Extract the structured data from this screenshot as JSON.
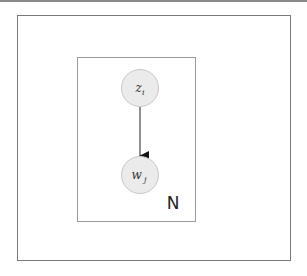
{
  "diagram": {
    "type": "plate-notation",
    "nodes": [
      {
        "id": "z",
        "base": "z",
        "subscript": "i",
        "fill": "#ebebeb",
        "stroke": "#c8c8c8"
      },
      {
        "id": "w",
        "base": "w",
        "subscript": "j",
        "fill": "#ebebeb",
        "stroke": "#c8c8c8"
      }
    ],
    "edges": [
      {
        "from": "z",
        "to": "w"
      }
    ],
    "plate": {
      "label": "N",
      "stroke": "#9a9a9a"
    }
  }
}
